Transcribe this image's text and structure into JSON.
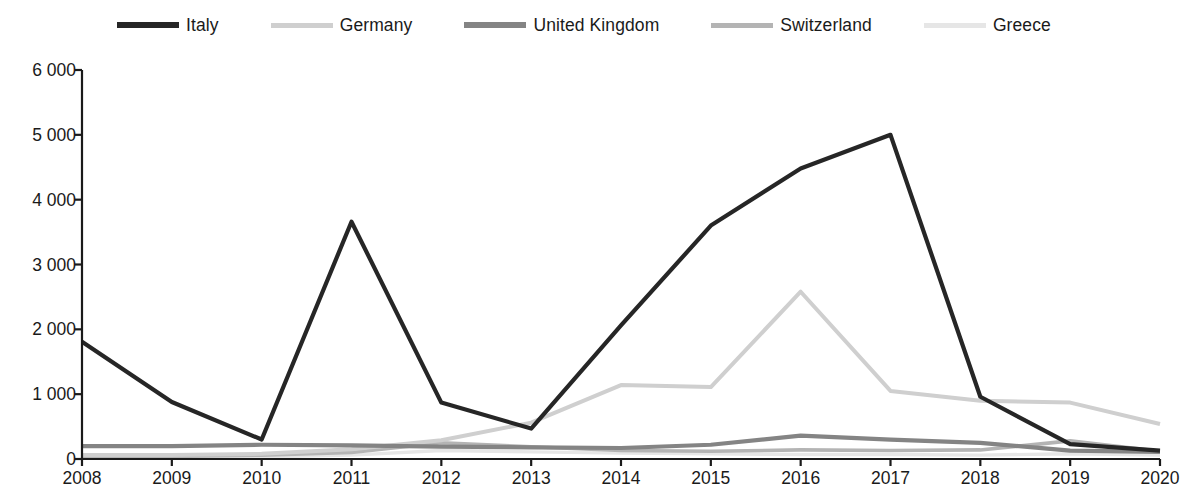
{
  "chart_data": {
    "type": "line",
    "title": "",
    "subtitle": "",
    "xlabel": "",
    "ylabel": "",
    "x": [
      2008,
      2009,
      2010,
      2011,
      2012,
      2013,
      2014,
      2015,
      2016,
      2017,
      2018,
      2019,
      2020
    ],
    "categories": [
      "2008",
      "2009",
      "2010",
      "2011",
      "2012",
      "2013",
      "2014",
      "2015",
      "2016",
      "2017",
      "2018",
      "2019",
      "2020"
    ],
    "ylim": [
      0,
      6000
    ],
    "ytick_values": [
      0,
      1000,
      2000,
      3000,
      4000,
      5000,
      6000
    ],
    "ytick_labels": [
      "0",
      "1 000",
      "2 000",
      "3 000",
      "4 000",
      "5 000",
      "6 000"
    ],
    "grid": false,
    "legend_position": "top",
    "series": [
      {
        "name": "Italy",
        "color": "#262626",
        "width": 4.2,
        "values": [
          1810,
          880,
          300,
          3660,
          870,
          470,
          2060,
          3600,
          4480,
          5000,
          960,
          230,
          130
        ]
      },
      {
        "name": "Germany",
        "color": "#cfcfcf",
        "width": 4.0,
        "values": [
          60,
          60,
          80,
          150,
          290,
          560,
          1140,
          1110,
          2580,
          1050,
          900,
          870,
          540
        ]
      },
      {
        "name": "United Kingdom",
        "color": "#848484",
        "width": 4.2,
        "values": [
          200,
          200,
          220,
          210,
          190,
          180,
          170,
          220,
          360,
          300,
          250,
          130,
          110
        ]
      },
      {
        "name": "Switzerland",
        "color": "#b4b4b4",
        "width": 3.6,
        "values": [
          30,
          40,
          60,
          100,
          250,
          190,
          130,
          120,
          140,
          130,
          140,
          280,
          120
        ]
      },
      {
        "name": "Greece",
        "color": "#e6e6e6",
        "width": 3.4,
        "values": [
          20,
          25,
          30,
          60,
          130,
          110,
          90,
          80,
          70,
          70,
          60,
          80,
          60
        ]
      }
    ]
  },
  "legend": {
    "items": [
      {
        "label": "Italy",
        "color": "#262626"
      },
      {
        "label": "Germany",
        "color": "#cfcfcf"
      },
      {
        "label": "United Kingdom",
        "color": "#848484"
      },
      {
        "label": "Switzerland",
        "color": "#b4b4b4"
      },
      {
        "label": "Greece",
        "color": "#e6e6e6"
      }
    ]
  },
  "axes": {
    "y_labels": [
      "6 000",
      "5 000",
      "4 000",
      "3 000",
      "2 000",
      "1 000",
      "0"
    ],
    "x_labels": [
      "2008",
      "2009",
      "2010",
      "2011",
      "2012",
      "2013",
      "2014",
      "2015",
      "2016",
      "2017",
      "2018",
      "2019",
      "2020"
    ]
  }
}
